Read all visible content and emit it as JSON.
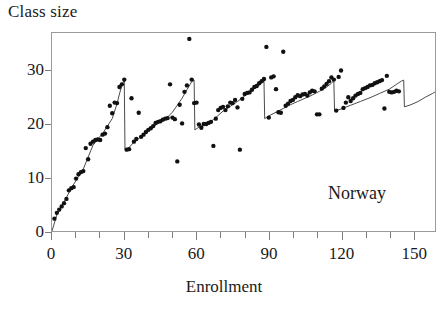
{
  "title": "Class size",
  "annotation": "Norway",
  "axes": {
    "x": {
      "label": "Enrollment",
      "ticks": [
        0,
        30,
        60,
        90,
        120,
        150
      ],
      "tick_labels": [
        "0",
        "30",
        "60",
        "90",
        "120",
        "150"
      ],
      "minor_tick_step": 10,
      "range": [
        0,
        159
      ]
    },
    "y": {
      "label": "Class size",
      "ticks": [
        0,
        10,
        20,
        30
      ],
      "tick_labels": [
        "0",
        "10",
        "20",
        "30"
      ],
      "range": [
        0,
        37
      ]
    }
  },
  "colors": {
    "point": "#111111",
    "line": "#4a4a4a",
    "frame": "#9a9a9a",
    "tick": "#7d7d7d",
    "text": "#1a1a1a",
    "background": "#ffffff"
  },
  "chart_data": {
    "type": "scatter",
    "title": "Class size",
    "xlabel": "Enrollment",
    "ylabel": "Class size",
    "xlim": [
      0,
      159
    ],
    "ylim": [
      0,
      37
    ],
    "grid": false,
    "legend": false,
    "annotations": [
      {
        "text": "Norway",
        "x": 118,
        "y": 8
      }
    ],
    "series": [
      {
        "name": "Average class size by enrollment",
        "type": "scatter",
        "marker": "filled-circle",
        "points": [
          [
            1,
            2.3
          ],
          [
            2,
            3.4
          ],
          [
            3,
            4.0
          ],
          [
            4,
            4.6
          ],
          [
            5,
            5.2
          ],
          [
            6,
            6.0
          ],
          [
            7,
            7.6
          ],
          [
            8,
            8.0
          ],
          [
            9,
            8.2
          ],
          [
            10,
            9.8
          ],
          [
            11,
            10.6
          ],
          [
            12,
            11.0
          ],
          [
            13,
            11.2
          ],
          [
            14,
            15.5
          ],
          [
            15,
            13.4
          ],
          [
            16,
            16.3
          ],
          [
            17,
            16.7
          ],
          [
            18,
            17.0
          ],
          [
            19,
            17.1
          ],
          [
            20,
            17.0
          ],
          [
            21,
            18.0
          ],
          [
            22,
            18.2
          ],
          [
            23,
            19.4
          ],
          [
            24,
            23.4
          ],
          [
            25,
            22.0
          ],
          [
            26,
            24.0
          ],
          [
            27,
            23.9
          ],
          [
            28,
            26.9
          ],
          [
            29,
            27.4
          ],
          [
            30,
            28.3
          ],
          [
            31,
            15.2
          ],
          [
            32,
            15.3
          ],
          [
            33,
            24.8
          ],
          [
            34,
            16.7
          ],
          [
            35,
            17.2
          ],
          [
            36,
            22.1
          ],
          [
            37,
            17.6
          ],
          [
            38,
            18.0
          ],
          [
            39,
            18.5
          ],
          [
            40,
            18.9
          ],
          [
            41,
            19.2
          ],
          [
            42,
            19.6
          ],
          [
            43,
            20.2
          ],
          [
            44,
            20.4
          ],
          [
            45,
            20.5
          ],
          [
            46,
            20.8
          ],
          [
            47,
            21.0
          ],
          [
            48,
            21.1
          ],
          [
            49,
            27.4
          ],
          [
            50,
            21.2
          ],
          [
            51,
            20.9
          ],
          [
            52,
            13.0
          ],
          [
            53,
            23.6
          ],
          [
            54,
            20.1
          ],
          [
            55,
            26.0
          ],
          [
            56,
            27.2
          ],
          [
            57,
            35.9
          ],
          [
            58,
            28.3
          ],
          [
            59,
            23.9
          ],
          [
            60,
            24.0
          ],
          [
            61,
            19.9
          ],
          [
            62,
            19.3
          ],
          [
            63,
            20.0
          ],
          [
            64,
            20.0
          ],
          [
            65,
            20.2
          ],
          [
            66,
            20.4
          ],
          [
            67,
            15.9
          ],
          [
            68,
            21.0
          ],
          [
            69,
            22.6
          ],
          [
            70,
            23.0
          ],
          [
            71,
            23.2
          ],
          [
            72,
            22.6
          ],
          [
            73,
            23.3
          ],
          [
            74,
            24.0
          ],
          [
            75,
            23.9
          ],
          [
            76,
            24.5
          ],
          [
            77,
            23.1
          ],
          [
            78,
            15.2
          ],
          [
            79,
            24.7
          ],
          [
            80,
            25.6
          ],
          [
            81,
            25.8
          ],
          [
            82,
            25.9
          ],
          [
            83,
            26.4
          ],
          [
            84,
            26.9
          ],
          [
            85,
            27.1
          ],
          [
            86,
            27.6
          ],
          [
            87,
            28.0
          ],
          [
            88,
            28.4
          ],
          [
            89,
            34.4
          ],
          [
            90,
            21.2
          ],
          [
            91,
            28.7
          ],
          [
            92,
            28.9
          ],
          [
            93,
            26.5
          ],
          [
            94,
            22.2
          ],
          [
            95,
            22.1
          ],
          [
            96,
            33.5
          ],
          [
            97,
            23.4
          ],
          [
            98,
            23.8
          ],
          [
            99,
            24.3
          ],
          [
            100,
            24.5
          ],
          [
            101,
            25.0
          ],
          [
            102,
            25.4
          ],
          [
            103,
            25.2
          ],
          [
            104,
            25.5
          ],
          [
            105,
            25.6
          ],
          [
            106,
            25.3
          ],
          [
            107,
            25.9
          ],
          [
            108,
            26.2
          ],
          [
            109,
            26.1
          ],
          [
            110,
            21.8
          ],
          [
            111,
            21.8
          ],
          [
            112,
            26.6
          ],
          [
            113,
            27.0
          ],
          [
            114,
            27.5
          ],
          [
            115,
            28.0
          ],
          [
            116,
            28.7
          ],
          [
            117,
            28.3
          ],
          [
            118,
            22.5
          ],
          [
            119,
            28.8
          ],
          [
            120,
            30.0
          ],
          [
            121,
            23.0
          ],
          [
            122,
            24.0
          ],
          [
            123,
            25.0
          ],
          [
            124,
            24.3
          ],
          [
            125,
            24.8
          ],
          [
            126,
            25.3
          ],
          [
            127,
            25.6
          ],
          [
            128,
            25.8
          ],
          [
            129,
            26.5
          ],
          [
            130,
            26.7
          ],
          [
            131,
            26.9
          ],
          [
            132,
            27.2
          ],
          [
            133,
            27.3
          ],
          [
            134,
            27.6
          ],
          [
            135,
            27.8
          ],
          [
            136,
            28.0
          ],
          [
            137,
            28.2
          ],
          [
            138,
            22.9
          ],
          [
            139,
            29.0
          ],
          [
            140,
            26.0
          ],
          [
            141,
            25.9
          ],
          [
            142,
            26.0
          ],
          [
            143,
            26.2
          ],
          [
            144,
            26.1
          ]
        ]
      },
      {
        "name": "Maimonides predicted class size",
        "type": "line",
        "style": "sawtooth",
        "points": [
          [
            0,
            0
          ],
          [
            2,
            3.0
          ],
          [
            5,
            5.4
          ],
          [
            8,
            8.0
          ],
          [
            11,
            10.2
          ],
          [
            13,
            11.6
          ],
          [
            15,
            13.8
          ],
          [
            17,
            16.0
          ],
          [
            19,
            17.2
          ],
          [
            21,
            18.2
          ],
          [
            23,
            19.6
          ],
          [
            25,
            21.0
          ],
          [
            27,
            23.8
          ],
          [
            28,
            25.6
          ],
          [
            29,
            27.2
          ],
          [
            30,
            28.3
          ],
          [
            30.3,
            15.2
          ],
          [
            32,
            15.6
          ],
          [
            34,
            16.6
          ],
          [
            36,
            17.3
          ],
          [
            38,
            18.1
          ],
          [
            40,
            18.8
          ],
          [
            42,
            19.4
          ],
          [
            44,
            20.1
          ],
          [
            46,
            20.8
          ],
          [
            48,
            21.3
          ],
          [
            50,
            22.2
          ],
          [
            52,
            23.5
          ],
          [
            54,
            24.8
          ],
          [
            56,
            26.4
          ],
          [
            58,
            27.9
          ],
          [
            59,
            28.2
          ],
          [
            59.3,
            18.9
          ],
          [
            61,
            19.4
          ],
          [
            63,
            19.9
          ],
          [
            65,
            20.3
          ],
          [
            67,
            20.8
          ],
          [
            69,
            21.6
          ],
          [
            71,
            22.4
          ],
          [
            73,
            23.0
          ],
          [
            75,
            23.6
          ],
          [
            77,
            24.2
          ],
          [
            79,
            24.9
          ],
          [
            81,
            25.6
          ],
          [
            83,
            26.3
          ],
          [
            85,
            27.0
          ],
          [
            87,
            27.6
          ],
          [
            88,
            28.0
          ],
          [
            88.3,
            21.0
          ],
          [
            90,
            21.5
          ],
          [
            93,
            22.2
          ],
          [
            96,
            22.9
          ],
          [
            99,
            23.6
          ],
          [
            102,
            24.2
          ],
          [
            105,
            24.8
          ],
          [
            108,
            25.4
          ],
          [
            111,
            26.1
          ],
          [
            114,
            26.9
          ],
          [
            116,
            27.6
          ],
          [
            117,
            28.1
          ],
          [
            117.3,
            22.4
          ],
          [
            120,
            22.8
          ],
          [
            124,
            23.5
          ],
          [
            128,
            24.2
          ],
          [
            132,
            24.9
          ],
          [
            136,
            25.7
          ],
          [
            140,
            26.5
          ],
          [
            143,
            27.4
          ],
          [
            145,
            28.0
          ],
          [
            146,
            28.2
          ],
          [
            146.3,
            23.2
          ],
          [
            149,
            23.6
          ],
          [
            152,
            24.2
          ],
          [
            155,
            25.0
          ],
          [
            158,
            25.7
          ],
          [
            159,
            26.0
          ]
        ]
      }
    ]
  }
}
